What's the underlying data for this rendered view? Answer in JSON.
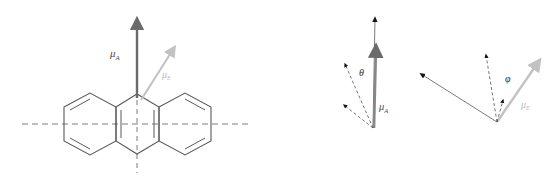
{
  "figure": {
    "width": 556,
    "height": 192,
    "background": "#ffffff"
  },
  "colors": {
    "absorption_dipole": "#6b6b6b",
    "emission_dipole": "#c2c2c2",
    "molecule_stroke": "#5a5a5a",
    "axis_dashed": "#7d7d7d",
    "angle_arrow_dark": "#151515",
    "label_dark": "#4a4a4a",
    "label_gray": "#b9b9b9"
  },
  "labels": {
    "mu_symbol": "μ",
    "mu_absorption_sub": "A",
    "mu_emission_sub": "E",
    "theta": "θ",
    "phi": "φ"
  },
  "panel_left": {
    "name": "anthracene-molecule-panel",
    "molecule": "anthracene",
    "ring_count": 3,
    "long_axis_label": "horizontal dashed axis",
    "short_axis_label": "vertical dashed axis",
    "vectors": [
      {
        "name": "mu-A",
        "label": "μA",
        "color": "#6b6b6b",
        "direction": "vertical up",
        "origin": [
          137,
          98
        ],
        "tip": [
          137,
          17
        ],
        "style": "solid-thick"
      },
      {
        "name": "mu-E",
        "label": "μE",
        "color": "#c2c2c2",
        "direction": "up and to the right",
        "origin": [
          142,
          100
        ],
        "tip": [
          176,
          46
        ],
        "style": "solid-thin"
      }
    ],
    "axes": [
      {
        "name": "long-axis",
        "orientation": "horizontal",
        "from": [
          22,
          124
        ],
        "to": [
          252,
          124
        ]
      },
      {
        "name": "short-axis",
        "orientation": "vertical",
        "from": [
          137,
          93
        ],
        "to": [
          137,
          173
        ]
      }
    ]
  },
  "panel_right": {
    "name": "vector-angle-panel",
    "clusters": [
      {
        "name": "theta-cluster",
        "angle_label": "θ",
        "vertex": [
          373,
          128
        ],
        "main_vectors": [
          {
            "name": "mu-A-black-thin",
            "color": "#151515",
            "tip": [
              375,
              14
            ]
          },
          {
            "name": "mu-A-gray-thick",
            "color": "#6b6b6b",
            "tip": [
              376,
              43
            ]
          }
        ],
        "dashed_vectors": [
          {
            "name": "dashed-upper-left",
            "tip": [
              341,
              61
            ]
          },
          {
            "name": "dashed-lower-left",
            "tip": [
              339,
              103
            ]
          }
        ],
        "label": "μA"
      },
      {
        "name": "phi-cluster",
        "angle_label": "φ",
        "vertex": [
          497,
          122
        ],
        "main_vectors": [
          {
            "name": "mu-E-gray",
            "color": "#c2c2c2",
            "tip": [
              541,
              58
            ]
          },
          {
            "name": "long-dark-arrow",
            "color": "#6b6b6b",
            "tip": [
              419,
              73
            ]
          }
        ],
        "dashed_vectors": [
          {
            "name": "dashed-upper-left",
            "tip": [
              483,
              51
            ]
          },
          {
            "name": "dashed-short-up",
            "tip": [
              503,
              97
            ]
          }
        ],
        "label": "μE"
      }
    ]
  }
}
